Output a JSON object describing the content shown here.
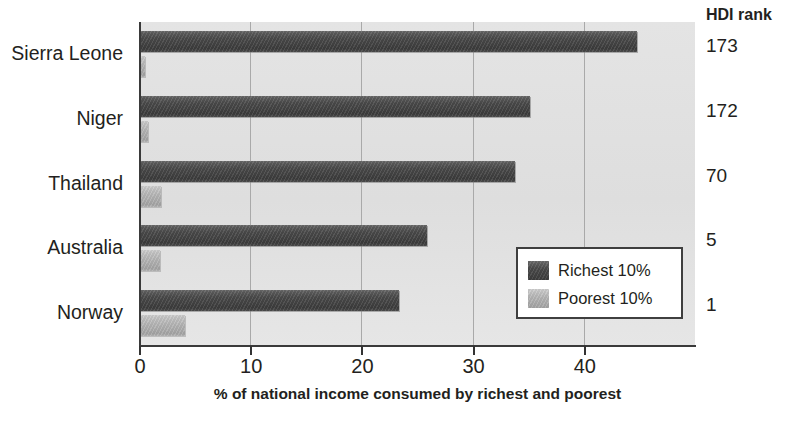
{
  "chart_data": {
    "type": "bar",
    "orientation": "horizontal",
    "title": "",
    "xlabel": "% of national income consumed by richest and poorest",
    "ylabel": "",
    "categories": [
      "Sierra Leone",
      "Niger",
      "Thailand",
      "Australia",
      "Norway"
    ],
    "series": [
      {
        "name": "Richest 10%",
        "color": "#444444",
        "values": [
          44.8,
          35.2,
          33.8,
          25.9,
          23.4
        ]
      },
      {
        "name": "Poorest 10%",
        "color": "#b6b6b6",
        "values": [
          0.5,
          0.8,
          2.0,
          1.9,
          4.1
        ]
      }
    ],
    "xticks": [
      0,
      10,
      20,
      30,
      40
    ],
    "xtick_labels": [
      "0",
      "10",
      "20",
      "30",
      "40"
    ],
    "xlim": [
      0,
      50
    ],
    "grid": true,
    "grid_axis": "x",
    "legend_position": "inside-bottom-right",
    "annotations": {
      "secondary_column_header": "HDI rank",
      "secondary_column_values": [
        "173",
        "172",
        "70",
        "5",
        "1"
      ]
    }
  },
  "axis": {
    "x_title": "% of national income consumed by richest and poorest",
    "ticks": [
      {
        "label": "0",
        "value": 0
      },
      {
        "label": "10",
        "value": 10
      },
      {
        "label": "20",
        "value": 20
      },
      {
        "label": "30",
        "value": 30
      },
      {
        "label": "40",
        "value": 40
      }
    ]
  },
  "categories": [
    {
      "label": "Sierra Leone",
      "hdi_rank": "173",
      "richest": 44.8,
      "poorest": 0.5
    },
    {
      "label": "Niger",
      "hdi_rank": "172",
      "richest": 35.2,
      "poorest": 0.8
    },
    {
      "label": "Thailand",
      "hdi_rank": "70",
      "richest": 33.8,
      "poorest": 2.0
    },
    {
      "label": "Australia",
      "hdi_rank": "5",
      "richest": 25.9,
      "poorest": 1.9
    },
    {
      "label": "Norway",
      "hdi_rank": "1",
      "richest": 23.4,
      "poorest": 4.1
    }
  ],
  "hdi": {
    "header": "HDI rank"
  },
  "legend": {
    "entries": [
      {
        "label": "Richest 10%",
        "key": "richest"
      },
      {
        "label": "Poorest 10%",
        "key": "poorest"
      }
    ]
  },
  "colors": {
    "richest": "#444444",
    "poorest": "#b6b6b6",
    "plot_background": "#e2e2e2",
    "gridline": "#a9a9a9",
    "axis": "#3a3a3a",
    "text": "#231f20"
  }
}
